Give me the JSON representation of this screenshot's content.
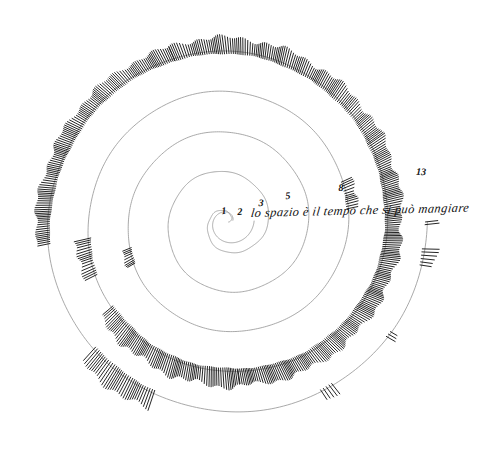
{
  "artwork": {
    "title": "lo spazio è il tempo che si può mangiare",
    "background_color": "#ffffff",
    "line_color": "#9a9a9a",
    "hatch_color": "#1a1a1a",
    "ink_color": "#101010",
    "width": 481,
    "height": 452
  },
  "caption": {
    "text": "lo spazio è il tempo che si può mangiare",
    "x": 250,
    "y": 218
  },
  "spiral": {
    "center_x": 228,
    "center_y": 222,
    "turns": 5,
    "max_radius": 200
  },
  "labels": [
    {
      "value": "1",
      "x": 224,
      "y": 211
    },
    {
      "value": "2",
      "x": 240,
      "y": 212
    },
    {
      "value": "3",
      "x": 261,
      "y": 203
    },
    {
      "value": "5",
      "x": 288,
      "y": 196
    },
    {
      "value": "8",
      "x": 341,
      "y": 188
    },
    {
      "value": "13",
      "x": 421,
      "y": 172
    }
  ],
  "chart_data": {
    "type": "line",
    "title": "lo spazio è il tempo che si può mangiare",
    "subtitle": "",
    "xlabel": "",
    "ylabel": "",
    "legend": [],
    "grid": false,
    "categories": [
      "1",
      "2",
      "3",
      "5",
      "8",
      "13"
    ],
    "values": [
      1,
      2,
      3,
      5,
      8,
      13
    ],
    "annotations": [
      {
        "label": "1",
        "radius_px": 10
      },
      {
        "label": "2",
        "radius_px": 22
      },
      {
        "label": "3",
        "radius_px": 40
      },
      {
        "label": "5",
        "radius_px": 66
      },
      {
        "label": "8",
        "radius_px": 117
      },
      {
        "label": "13",
        "radius_px": 196
      }
    ],
    "xlim": [
      0,
      13
    ],
    "ylim": [
      0,
      13
    ]
  }
}
